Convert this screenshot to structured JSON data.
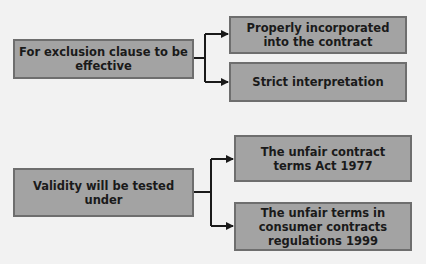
{
  "diagram": {
    "groups": [
      {
        "source": "For exclusion clause to be effective",
        "targets": [
          "Properly incorporated into the contract",
          "Strict interpretation"
        ]
      },
      {
        "source": "Validity will be tested under",
        "targets": [
          "The unfair contract terms Act 1977",
          "The unfair terms in consumer contracts regulations 1999"
        ]
      }
    ],
    "colors": {
      "box_fill": "#a3a3a3",
      "box_border": "#6e6e6e",
      "connector": "#1a1a1a",
      "background": "#f2f2f2"
    }
  }
}
